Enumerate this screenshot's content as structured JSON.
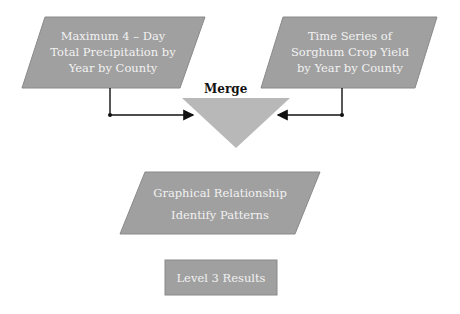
{
  "diagram": {
    "colors": {
      "shape_fill": "#a0a0a0",
      "shape_stroke": "#8a8a8a",
      "triangle_fill": "#b8b8b8",
      "text_on_shape": "#f2f2f2",
      "arrow": "#111111"
    },
    "inputs": [
      {
        "id": "precip",
        "lines": [
          "Maximum 4 – Day",
          "Total Precipitation by",
          "Year by County"
        ]
      },
      {
        "id": "yield",
        "lines": [
          "Time Series of",
          "Sorghum Crop Yield",
          "by Year by County"
        ]
      }
    ],
    "merge": {
      "label": "Merge"
    },
    "process": {
      "lines": [
        "Graphical Relationship",
        "Identify Patterns"
      ]
    },
    "result": {
      "label": "Level 3 Results"
    }
  }
}
